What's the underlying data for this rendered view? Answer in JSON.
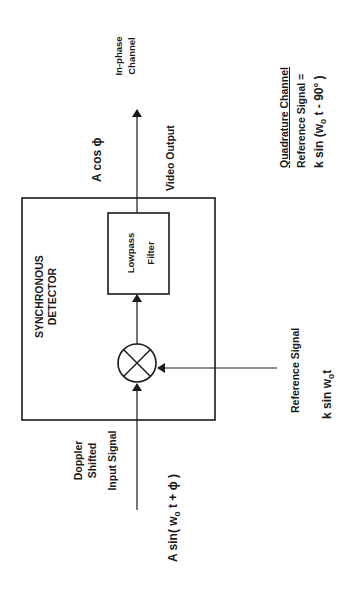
{
  "diagram": {
    "detector_title": [
      "SYNCHRONOUS",
      "DETECTOR"
    ],
    "filter_label": [
      "Lowpass",
      "Filter"
    ],
    "input": {
      "label": [
        "Doppler",
        "Shifted",
        "Input Signal"
      ],
      "formula_prefix": "A sin( w",
      "formula_sub": "o",
      "formula_suffix": " t + ϕ )"
    },
    "output": {
      "channel_label": [
        "In-phase",
        "Channel"
      ],
      "formula": "A cos ϕ",
      "video_label": "Video Output"
    },
    "reference": {
      "label": "Reference Signal",
      "formula_prefix": "k sin w",
      "formula_sub": "o",
      "formula_suffix": "t"
    },
    "quadrature": {
      "title": "Quadrature Channel",
      "line2": "Reference Signal  =",
      "formula_prefix": "k sin (w",
      "formula_sub": "o",
      "formula_suffix": " t - 90° )"
    },
    "mixer_symbol": "multiplier-circle",
    "colors": {
      "line": "#1a1a1a",
      "background": "#ffffff"
    }
  }
}
